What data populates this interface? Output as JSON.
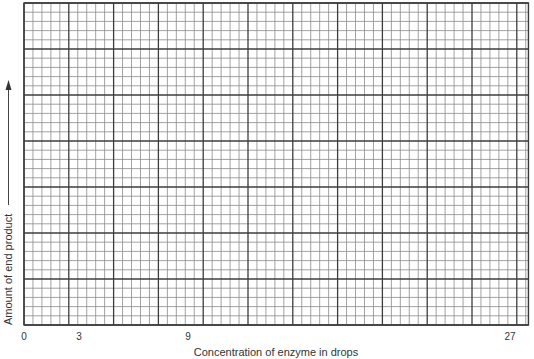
{
  "chart_data": {
    "type": "line",
    "title": "",
    "xlabel": "Concentration of enzyme in drops",
    "ylabel": "Amount of end product",
    "x_tick_labels": [
      {
        "label": "0",
        "value": 0
      },
      {
        "label": "3",
        "value": 3
      },
      {
        "label": "9",
        "value": 9
      },
      {
        "label": "27",
        "value": 27
      }
    ],
    "y_tick_labels": [],
    "series": [],
    "grid": true,
    "grid_structure": {
      "major_columns": 11,
      "extra_minor_columns": 1.3,
      "major_rows": 7,
      "minor_per_major": 5
    },
    "y_axis_arrow": true,
    "legend": "none",
    "note": "Blank graph paper; no data plotted"
  }
}
